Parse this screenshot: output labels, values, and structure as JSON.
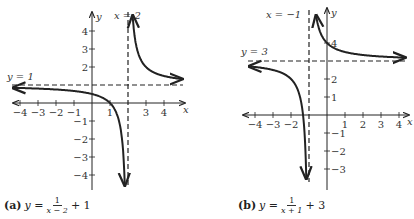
{
  "chart_data": [
    {
      "type": "line",
      "title": "(a) y = 1/(x - 2) + 1",
      "caption": {
        "label": "(a)",
        "lhs": "y =",
        "num": "1",
        "den": "x − 2",
        "tail": "+ 1"
      },
      "xlabel": "x",
      "ylabel": "y",
      "xlim": [
        -4.5,
        4.5
      ],
      "ylim": [
        -4.5,
        4.5
      ],
      "x_ticks": [
        -4,
        -3,
        -2,
        -1,
        1,
        3,
        4
      ],
      "x_tick_labels": [
        "−4",
        "−3",
        "−2",
        "−1",
        "1",
        "3",
        "4"
      ],
      "y_ticks": [
        4,
        3,
        2,
        -1,
        -2,
        -3,
        -4
      ],
      "y_tick_labels": [
        "4",
        "3",
        "2",
        "−1",
        "−2",
        "−3",
        "−4"
      ],
      "asymptotes": {
        "vertical": {
          "x": 2,
          "label": "x = 2"
        },
        "horizontal": {
          "y": 1,
          "label": "y = 1"
        }
      },
      "series": [
        {
          "name": "f(x) = 1/(x-2) + 1",
          "function": "1/(x-2)+1"
        }
      ],
      "grid": false
    },
    {
      "type": "line",
      "title": "(b) y = 1/(x + 1) + 3",
      "caption": {
        "label": "(b)",
        "lhs": "y =",
        "num": "1",
        "den": "x + 1",
        "tail": "+ 3"
      },
      "xlabel": "x",
      "ylabel": "y",
      "xlim": [
        -4.5,
        4.5
      ],
      "ylim": [
        -3.8,
        4.5
      ],
      "x_ticks": [
        -4,
        -3,
        -2,
        1,
        2,
        3,
        4
      ],
      "x_tick_labels": [
        "−4",
        "−3",
        "−2",
        "1",
        "2",
        "3",
        "4"
      ],
      "y_ticks": [
        4,
        2,
        1,
        -1,
        -2,
        -3
      ],
      "y_tick_labels": [
        "4",
        "2",
        "1",
        "−1",
        "−2",
        "−3"
      ],
      "asymptotes": {
        "vertical": {
          "x": -1,
          "label": "x = −1"
        },
        "horizontal": {
          "y": 3,
          "label": "y = 3"
        }
      },
      "series": [
        {
          "name": "f(x) = 1/(x+1) + 3",
          "function": "1/(x+1)+3"
        }
      ],
      "grid": false
    }
  ]
}
